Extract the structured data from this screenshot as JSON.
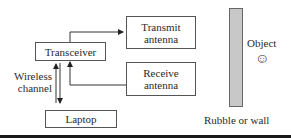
{
  "diagram": {
    "nodes": {
      "transceiver": "Transceiver",
      "transmit_antenna_line1": "Transmit",
      "transmit_antenna_line2": "antenna",
      "receive_antenna_line1": "Receive",
      "receive_antenna_line2": "antenna",
      "laptop": "Laptop"
    },
    "labels": {
      "wireless_line1": "Wireless",
      "wireless_line2": "channel",
      "object": "Object",
      "object_icon": "☺",
      "wall": "Rubble or wall"
    },
    "edges": [
      {
        "from": "transceiver",
        "to": "transmit_antenna"
      },
      {
        "from": "receive_antenna",
        "to": "transceiver"
      },
      {
        "from": "transceiver",
        "to": "laptop",
        "bidirectional": true,
        "label": "Wireless channel"
      }
    ],
    "colors": {
      "wall_fill": "#c8c8c8",
      "line": "#333333"
    }
  }
}
